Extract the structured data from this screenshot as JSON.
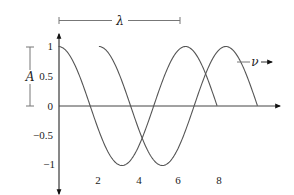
{
  "diagram": {
    "title": "",
    "axes": {
      "y_ticks": [
        {
          "value": 1,
          "label": "1"
        },
        {
          "value": 0.5,
          "label": "0.5"
        },
        {
          "value": 0,
          "label": "0"
        },
        {
          "value": -0.5,
          "label": "−0.5"
        },
        {
          "value": -1,
          "label": "−1"
        }
      ],
      "x_ticks": [
        {
          "value": 2,
          "label": "2"
        },
        {
          "value": 4,
          "label": "4"
        },
        {
          "value": 6,
          "label": "6"
        },
        {
          "value": 8,
          "label": "8"
        }
      ]
    },
    "annotations": {
      "wavelength_symbol": "λ",
      "amplitude_symbol": "A",
      "velocity_symbol": "ν"
    },
    "waves": [
      {
        "name": "wave-1",
        "function": "cos(x)",
        "x_start": 0,
        "x_end": 7.85
      },
      {
        "name": "wave-2",
        "function": "cos(x - 2)",
        "x_start": 2,
        "x_end": 9.85
      }
    ],
    "colors": {
      "curve": "#555555",
      "axis": "#222222",
      "annotation": "#777777"
    }
  }
}
